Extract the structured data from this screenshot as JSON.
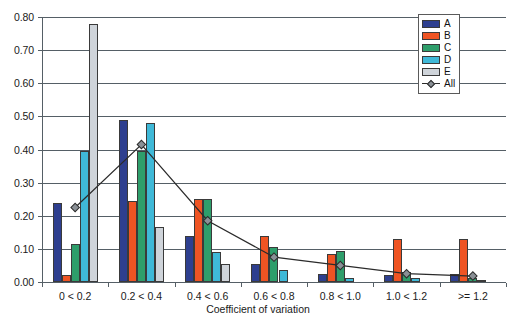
{
  "chart_data": {
    "type": "bar",
    "title": "",
    "xlabel": "Coefficient of variation",
    "ylabel": "",
    "categories": [
      "0 < 0.2",
      "0.2 < 0.4",
      "0.4 < 0.6",
      "0.6 < 0.8",
      "0.8 < 1.0",
      "1.0 < 1.2",
      ">= 1.2"
    ],
    "ylim": [
      0.0,
      0.8
    ],
    "yticks": [
      "0.00",
      "0.10",
      "0.20",
      "0.30",
      "0.40",
      "0.50",
      "0.60",
      "0.70",
      "0.80"
    ],
    "ytick_values": [
      0.0,
      0.1,
      0.2,
      0.3,
      0.4,
      0.5,
      0.6,
      0.7,
      0.8
    ],
    "grid": true,
    "legend_position": "top-right",
    "series": [
      {
        "name": "A",
        "type": "bar",
        "color": "#2e3f8f",
        "values": [
          0.24,
          0.49,
          0.14,
          0.055,
          0.025,
          0.02,
          0.025
        ]
      },
      {
        "name": "B",
        "type": "bar",
        "color": "#ef5423",
        "values": [
          0.02,
          0.245,
          0.25,
          0.14,
          0.085,
          0.13,
          0.13
        ]
      },
      {
        "name": "C",
        "type": "bar",
        "color": "#2e9e6b",
        "values": [
          0.115,
          0.395,
          0.25,
          0.105,
          0.095,
          0.03,
          0.012
        ]
      },
      {
        "name": "D",
        "type": "bar",
        "color": "#3fb9d8",
        "values": [
          0.395,
          0.48,
          0.09,
          0.035,
          0.012,
          0.012,
          0.005
        ]
      },
      {
        "name": "E",
        "type": "bar",
        "color": "#cfd4da",
        "values": [
          0.78,
          0.165,
          0.055,
          0.0,
          0.0,
          0.0,
          0.0
        ]
      },
      {
        "name": "All",
        "type": "line",
        "color": "#2b2b2b",
        "marker": "diamond",
        "marker_color": "#8a9096",
        "values": [
          0.225,
          0.415,
          0.185,
          0.075,
          0.05,
          0.025,
          0.018
        ]
      }
    ]
  },
  "legend": {
    "items": [
      {
        "label": "A"
      },
      {
        "label": "B"
      },
      {
        "label": "C"
      },
      {
        "label": "D"
      },
      {
        "label": "E"
      },
      {
        "label": "All"
      }
    ]
  },
  "colors": {
    "series_a": "#2e3f8f",
    "series_b": "#ef5423",
    "series_c": "#2e9e6b",
    "series_d": "#3fb9d8",
    "series_e": "#cfd4da",
    "line_all": "#2b2b2b",
    "axis": "#555f66",
    "background": "#ffffff"
  }
}
